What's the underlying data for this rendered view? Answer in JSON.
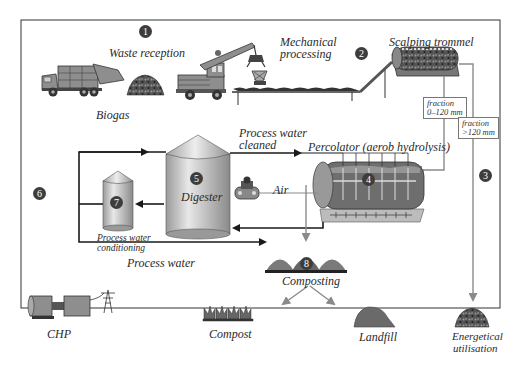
{
  "diagram": {
    "steps": [
      {
        "number": "1",
        "label": "Waste reception"
      },
      {
        "number": "2",
        "label": "Scalping trommel"
      },
      {
        "number": "3",
        "label": "Energetical utilisation"
      },
      {
        "number": "4",
        "label": "Percolator (aerob hydrolysis)"
      },
      {
        "number": "5",
        "label": "Digester"
      },
      {
        "number": "6",
        "label": "CHP"
      },
      {
        "number": "7",
        "label": "Process water conditioning"
      },
      {
        "number": "8",
        "label": "Composting"
      }
    ],
    "labels": {
      "waste_reception": "Waste reception",
      "mechanical_processing_1": "Mechanical",
      "mechanical_processing_2": "processing",
      "scalping_trommel": "Scalping trommel",
      "biogas": "Biogas",
      "process_water_cleaned_1": "Process water",
      "process_water_cleaned_2": "cleaned",
      "percolator": "Percolator (aerob hydrolysis)",
      "air": "Air",
      "digester": "Digester",
      "process_water_conditioning_1": "Process water",
      "process_water_conditioning_2": "conditioning",
      "process_water": "Process water",
      "composting": "Composting",
      "chp": "CHP",
      "compost": "Compost",
      "landfill": "Landfill",
      "energetical_utilisation_1": "Energetical",
      "energetical_utilisation_2": "utilisation",
      "fraction_small_1": "fraction",
      "fraction_small_2": "0–120 mm",
      "fraction_large_1": "fraction",
      "fraction_large_2": ">120 mm"
    },
    "numbers": {
      "n1": "1",
      "n2": "2",
      "n3": "3",
      "n4": "4",
      "n5": "5",
      "n6": "6",
      "n7": "7",
      "n8": "8"
    },
    "colors": {
      "line_dark": "#1a1a1a",
      "line_grey": "#8a8a8a",
      "tank_fill": "#c8c8c8",
      "vehicle_fill": "#8e8e8e",
      "pile_fill": "#7a7a7a"
    }
  }
}
